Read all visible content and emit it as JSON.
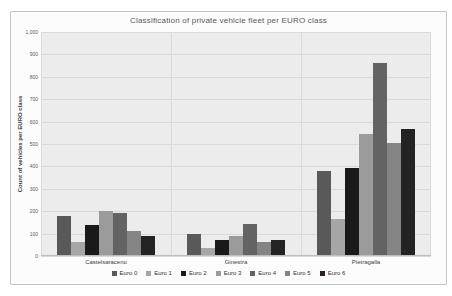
{
  "chart_data": {
    "type": "bar",
    "title": "Classification of private vehicle fleet per EURO class",
    "xlabel": "",
    "ylabel": "Count of vehicles per EURO class",
    "ylim": [
      0,
      1000
    ],
    "ytick_step": 100,
    "ytick_labels": [
      "0",
      "100",
      "200",
      "300",
      "400",
      "500",
      "600",
      "700",
      "800",
      "900",
      "1,000"
    ],
    "grid": true,
    "legend_position": "bottom",
    "categories": [
      "Castelsaraceno",
      "Ginestra",
      "Pietragalla"
    ],
    "series": [
      {
        "name": "Euro 0",
        "color": "#595959",
        "values": [
          180,
          100,
          380
        ]
      },
      {
        "name": "Euro 1",
        "color": "#a6a6a6",
        "values": [
          62,
          35,
          165
        ]
      },
      {
        "name": "Euro 2",
        "color": "#1a1a1a",
        "values": [
          140,
          70,
          395
        ]
      },
      {
        "name": "Euro 3",
        "color": "#9b9b9b",
        "values": [
          200,
          88,
          545
        ]
      },
      {
        "name": "Euro 4",
        "color": "#636363",
        "values": [
          190,
          145,
          860
        ]
      },
      {
        "name": "Euro 5",
        "color": "#858585",
        "values": [
          110,
          62,
          505
        ]
      },
      {
        "name": "Euro 6",
        "color": "#232323",
        "values": [
          90,
          72,
          565
        ]
      }
    ]
  }
}
